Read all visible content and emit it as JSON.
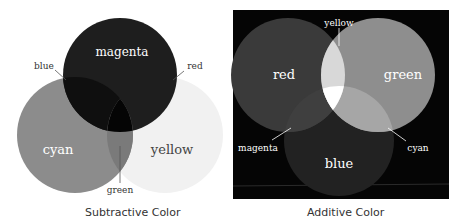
{
  "subtractive": {
    "caption": "Subtractive Color",
    "circles": [
      {
        "name": "magenta",
        "label": "magenta",
        "fill": "#1e1e1e"
      },
      {
        "name": "cyan",
        "label": "cyan",
        "fill": "#8c8c8c"
      },
      {
        "name": "yellow",
        "label": "yellow",
        "fill": "#efefef"
      }
    ],
    "overlap_labels": {
      "blue": "blue",
      "red": "red",
      "green": "green"
    }
  },
  "additive": {
    "caption": "Additive Color",
    "background": "#050505",
    "circles": [
      {
        "name": "red",
        "label": "red",
        "fill": "#3a3a3a"
      },
      {
        "name": "green",
        "label": "green",
        "fill": "#8e8e8e"
      },
      {
        "name": "blue",
        "label": "blue",
        "fill": "#222222"
      }
    ],
    "overlap_labels": {
      "yellow": "yellow",
      "magenta": "magenta",
      "cyan": "cyan"
    }
  }
}
